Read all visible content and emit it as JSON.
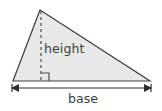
{
  "figure": {
    "canvas": {
      "width": 162,
      "height": 111,
      "background": "#ffffff"
    },
    "shape": {
      "name": "triangle",
      "type": "obtuse-scalene",
      "fill_color": "#e8e8e8",
      "stroke_color": "#3f3f3f",
      "stroke_width": 1.2,
      "vertices": [
        {
          "name": "apex",
          "x": 40,
          "y": 10
        },
        {
          "name": "bottom-right",
          "x": 150,
          "y": 81
        },
        {
          "name": "bottom-left",
          "x": 13,
          "y": 81
        }
      ],
      "points_path": "40,10 150,81 13,81"
    },
    "height_line": {
      "label": "height",
      "x": 41,
      "y_top": 11,
      "y_bottom": 81,
      "style": "dashed",
      "dash_pattern": "3,3",
      "color": "#4a4a4a",
      "stroke_width": 1.2
    },
    "right_angle_marker": {
      "name": "right-angle",
      "corner_x": 41,
      "corner_y": 81,
      "size": 8,
      "color": "#4a4a4a",
      "path": "M 41 73 L 49 73 L 49 81"
    },
    "base_dimension": {
      "label": "base",
      "y": 88,
      "x_start": 11,
      "x_end": 152,
      "color": "#2e2e2e",
      "stroke_width": 1.2,
      "arrowheads": "both",
      "arrow_size": 5
    },
    "labels": {
      "height": "height",
      "base": "base",
      "text_color": "#3c3c3c",
      "font_size_px": 12.5
    }
  }
}
